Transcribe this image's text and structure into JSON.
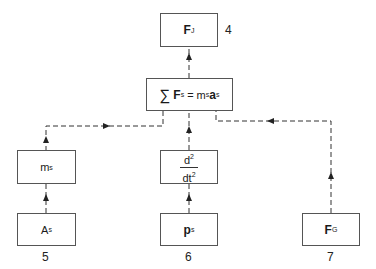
{
  "diagram": {
    "nodes": {
      "fj": {
        "main": "F",
        "sub": "J",
        "number": "4"
      },
      "sum": {
        "sigma": "∑",
        "lhs_main": "F",
        "lhs_sub": "s",
        "eq": "=",
        "m": "m",
        "m_sub": "s",
        "a": "a",
        "a_sub": "s"
      },
      "ms": {
        "main": "m",
        "sub": "s"
      },
      "deriv": {
        "num": "d",
        "num_sup": "2",
        "den": "dt",
        "den_sup": "2"
      },
      "as": {
        "main": "A",
        "sub": "s",
        "number": "5"
      },
      "ps": {
        "main": "p",
        "sub": "s",
        "number": "6"
      },
      "fg": {
        "main": "F",
        "sub": "G",
        "number": "7"
      }
    },
    "edges": [
      {
        "from": "sum",
        "to": "fj",
        "style": "dashed"
      },
      {
        "from": "sum",
        "to": "ms",
        "style": "dashed",
        "arrow_direction": "right"
      },
      {
        "from": "deriv",
        "to": "sum",
        "style": "dashed"
      },
      {
        "from": "fg",
        "to": "sum",
        "style": "dashed",
        "arrow_direction": "left"
      },
      {
        "from": "as",
        "to": "ms",
        "style": "dashed"
      },
      {
        "from": "ps",
        "to": "deriv",
        "style": "dashed"
      }
    ],
    "colors": {
      "stroke": "#555555",
      "text": "#1a1a1a"
    }
  }
}
